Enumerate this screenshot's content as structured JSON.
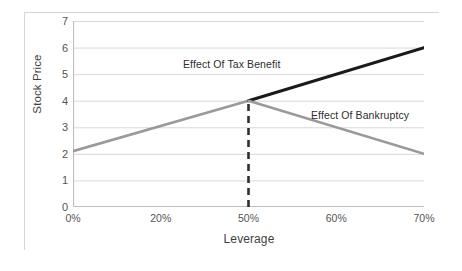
{
  "chart_data": {
    "type": "line",
    "title": "",
    "subtitle": "",
    "xlabel": "Leverage",
    "ylabel": "Stock Price",
    "categories": [
      "0%",
      "20%",
      "50%",
      "60%",
      "70%"
    ],
    "x_tick_labels": [
      "0%",
      "20%",
      "50%",
      "60%",
      "70%"
    ],
    "y_tick_labels": [
      "0",
      "1",
      "2",
      "3",
      "4",
      "5",
      "6",
      "7"
    ],
    "ylim": [
      0,
      7
    ],
    "y_major_step": 1,
    "grid": "horizontal",
    "legend": "none",
    "series": [
      {
        "name": "Levered value (rising)",
        "color": "#9a9a9a",
        "style": "solid",
        "width": 2.6,
        "points": [
          {
            "x": "0%",
            "y": 2.1
          },
          {
            "x": "50%",
            "y": 4.0
          }
        ]
      },
      {
        "name": "Effect Of Tax Benefit",
        "color": "#1a1a1a",
        "style": "solid",
        "width": 3.0,
        "points": [
          {
            "x": "50%",
            "y": 4.0
          },
          {
            "x": "70%",
            "y": 6.0
          }
        ]
      },
      {
        "name": "Effect Of Bankruptcy",
        "color": "#9a9a9a",
        "style": "solid",
        "width": 2.6,
        "points": [
          {
            "x": "50%",
            "y": 4.0
          },
          {
            "x": "70%",
            "y": 2.0
          }
        ]
      }
    ],
    "reference_lines": [
      {
        "name": "optimal-leverage-marker",
        "orientation": "vertical",
        "x": "50%",
        "y_from": 0,
        "y_to": 4.0,
        "style": "dashed",
        "color": "#2e2e2e",
        "width": 2.6
      }
    ],
    "annotations": [
      {
        "text": "Effect Of Tax Benefit",
        "x": "35%",
        "y": 5.35
      },
      {
        "text": "Effect Of Bankruptcy",
        "x": "62%",
        "y": 3.55
      }
    ],
    "colors": {
      "gridline": "#d9d9d9",
      "axis": "#bfbfbf",
      "frame": "#d6d6d6",
      "tick_text": "#555555",
      "title_text": "#3f3f3f",
      "series_gray": "#9a9a9a",
      "series_black": "#1a1a1a",
      "background": "#ffffff"
    }
  }
}
